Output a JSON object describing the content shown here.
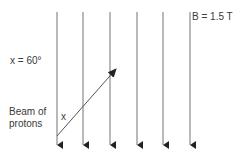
{
  "labels": {
    "angle": "x = 60°",
    "beam": "Beam of protons",
    "field": "B = 1.5 T",
    "angle_mark": "x"
  },
  "field_lines": {
    "count": 6,
    "direction": "down",
    "x_positions": [
      57,
      83,
      110,
      137,
      163,
      190
    ],
    "y_start": 12,
    "y_end": 148,
    "color": "#8a8a8a"
  },
  "beam_arrow": {
    "from": [
      57,
      136
    ],
    "to": [
      117,
      68
    ],
    "color": "#555555"
  },
  "colors": {
    "arrowhead": "#222222",
    "text": "#3a3a3a"
  }
}
